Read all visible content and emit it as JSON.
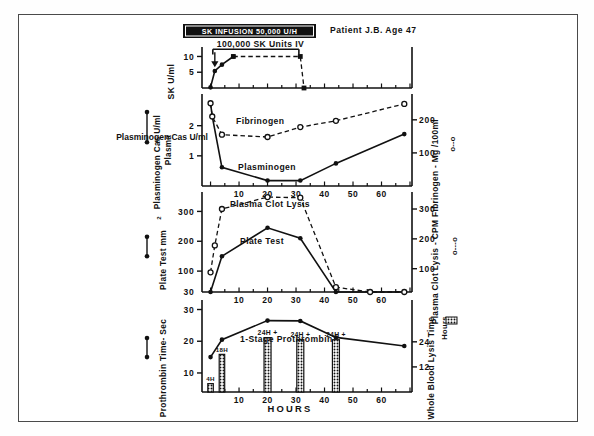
{
  "figure": {
    "header_box_label": "SK INFUSION 50,000 U/H",
    "patient_label": "Patient J.B. Age 47",
    "bolus_label": "100,000 SK Units IV",
    "x_axis_title": "HOURS",
    "x_ticks": [
      10,
      20,
      30,
      40,
      50,
      60
    ],
    "x_range": [
      -3,
      70
    ]
  },
  "panels": [
    {
      "id": "panel-sk",
      "left_axis_label": "SK U/ml",
      "right_axis_label": "",
      "y_ticks": [
        5,
        10
      ],
      "y_range": [
        0,
        13
      ],
      "series": [
        {
          "name": "SK Level",
          "style": "solid",
          "marker": "filled-circle",
          "x": [
            0,
            1.5,
            4,
            8
          ],
          "y": [
            0.2,
            5.4,
            7.4,
            10.0
          ]
        },
        {
          "name": "SK Level Plateau / Fall",
          "style": "dashed",
          "marker": "filled-square",
          "x": [
            8,
            31.5,
            32.8
          ],
          "y": [
            10.0,
            10.0,
            0.0
          ]
        }
      ]
    },
    {
      "id": "panel-plasminogen-fibrinogen",
      "left_axis_label": "Plasminogen  Cas U/ml Plasma",
      "right_axis_label": "Fibrinogen - Mg /100ml",
      "right_axis_legend": "o--o",
      "y_ticks_left": [
        1,
        2
      ],
      "y_ticks_right": [
        100,
        200
      ],
      "series": [
        {
          "name": "Plasminogen",
          "label": "Plasminogen",
          "style": "solid",
          "marker": "filled-circle",
          "axis": "left",
          "x": [
            0,
            0.6,
            4,
            20,
            31.5,
            44,
            68
          ],
          "y": [
            2.75,
            2.3,
            0.62,
            0.18,
            0.18,
            0.75,
            1.72
          ]
        },
        {
          "name": "Fibrinogen",
          "label": "Fibrinogen",
          "style": "dashed",
          "marker": "open-circle",
          "axis": "right",
          "x": [
            0,
            0.6,
            4,
            20,
            31.5,
            44,
            68
          ],
          "y": [
            250,
            210,
            155,
            148,
            178,
            197,
            248
          ]
        }
      ]
    },
    {
      "id": "panel-plate-clotlysis",
      "left_axis_label": "Plate Test  mm²",
      "right_axis_label": "Plasma Clot Lysis - CPM",
      "right_axis_legend": "o---o",
      "y_ticks_left": [
        100,
        200,
        300
      ],
      "y_ticks_right": [
        100,
        200,
        300
      ],
      "baseline_left_label": "30",
      "series": [
        {
          "name": "Plate Test",
          "label": "Plate Test",
          "style": "solid",
          "marker": "filled-circle",
          "axis": "left",
          "x": [
            0,
            4,
            20,
            31.5,
            44,
            68
          ],
          "y": [
            30,
            150,
            245,
            210,
            30,
            30
          ]
        },
        {
          "name": "Plasma Clot Lysis",
          "label": "Plasma Clot Lysis",
          "style": "dashed",
          "marker": "open-circle",
          "axis": "right",
          "x": [
            0,
            1.5,
            4,
            20,
            31.5,
            44,
            56,
            68
          ],
          "y": [
            88,
            178,
            300,
            340,
            338,
            38,
            22,
            22
          ]
        }
      ]
    },
    {
      "id": "panel-prothrombin",
      "left_axis_label": "Prothrombin Time- Sec",
      "right_axis_label": "Whole Blood Lysis Time",
      "right_axis_sublabel": "Hours",
      "right_axis_legend_block": true,
      "y_ticks_left": [
        10,
        20,
        30
      ],
      "y_ticks_right": [
        12,
        24
      ],
      "series": [
        {
          "name": "1-Stage Prothrombin",
          "label": "1-Stage Prothrombin",
          "style": "solid",
          "marker": "filled-circle",
          "axis": "left",
          "x": [
            0,
            4,
            20,
            31.5,
            44,
            68
          ],
          "y": [
            15.0,
            20.5,
            26.5,
            26.4,
            21.2,
            18.5
          ]
        }
      ],
      "bars": [
        {
          "x": 0,
          "label": "4H",
          "value_hours": 4
        },
        {
          "x": 4,
          "label": "18H",
          "value_hours": 18
        },
        {
          "x": 20,
          "label": "24H +",
          "value_hours": 26
        },
        {
          "x": 31.5,
          "label": "24H +",
          "value_hours": 25
        },
        {
          "x": 44,
          "label": "24H +",
          "value_hours": 25
        }
      ]
    }
  ],
  "colors": {
    "ink": "#111111",
    "frame": "#4a4a4a",
    "paper": "#ffffff"
  }
}
